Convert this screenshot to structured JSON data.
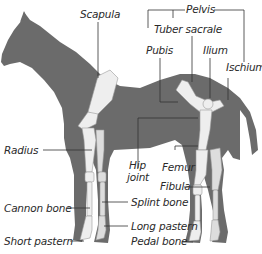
{
  "diagram": {
    "colors": {
      "body": "#6b6b6b",
      "bone": "#eeeeee",
      "bone_shade": "#c8c8c8",
      "line": "#333333",
      "text": "#2a2a2a",
      "background": "#ffffff"
    },
    "labels": {
      "scapula": "Scapula",
      "pelvis": "Pelvis",
      "tuber_sacrale": "Tuber sacrale",
      "pubis": "Pubis",
      "ilium": "Ilium",
      "ischium": "Ischium",
      "radius": "Radius",
      "hip_joint_line1": "Hip",
      "hip_joint_line2": "joint",
      "femur": "Femur",
      "fibula": "Fibula",
      "cannon_bone": "Cannon bone",
      "splint_bone": "Splint bone",
      "long_pastern": "Long pastern",
      "short_pastern": "Short pastern",
      "pedal_bone": "Pedal bone"
    }
  }
}
